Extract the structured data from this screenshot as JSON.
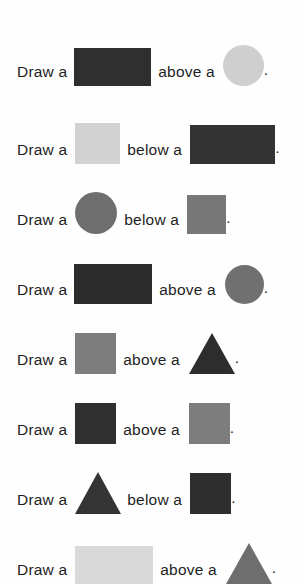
{
  "page": {
    "background": "#fefefe",
    "text_color": "#1f1f1f",
    "width": 305,
    "height": 582,
    "font_size_px": 15.5
  },
  "palette": {
    "very_dark": "#2e2e2e",
    "dark": "#333333",
    "darker": "#2b2b2b",
    "medium_gray": "#808080",
    "gray": "#7a7a7a",
    "light_gray": "#cccccc",
    "very_light_gray": "#d8d8d8",
    "pale_gray": "#dcdcdc"
  },
  "lead_text": "Draw a",
  "period": ".",
  "rows": [
    {
      "index": 1,
      "lead": "Draw a",
      "relation": "above a",
      "period": ".",
      "subject": {
        "shape": "rectangle",
        "color": "#2f2f2f",
        "width": 77,
        "height": 38,
        "label": "dark rectangle"
      },
      "object": {
        "shape": "circle",
        "color": "#cfcfcf",
        "width": 41,
        "height": 41,
        "label": "light gray circle"
      },
      "y": 14,
      "subject_left": 7,
      "relation_gap": 7,
      "object_gap": 8
    },
    {
      "index": 2,
      "lead": "Draw a",
      "relation": "below a",
      "period": ".",
      "subject": {
        "shape": "square",
        "color": "#d2d2d2",
        "width": 45,
        "height": 41,
        "label": "light gray square"
      },
      "object": {
        "shape": "rectangle",
        "color": "#333333",
        "width": 85,
        "height": 39,
        "label": "dark rectangle"
      },
      "y": 92,
      "subject_left": 8,
      "relation_gap": 7,
      "object_gap": 8
    },
    {
      "index": 3,
      "lead": "Draw a",
      "relation": "below a",
      "period": ".",
      "subject": {
        "shape": "circle",
        "color": "#6e6e6e",
        "width": 42,
        "height": 42,
        "label": "gray circle"
      },
      "object": {
        "shape": "square",
        "color": "#787878",
        "width": 39,
        "height": 39,
        "label": "gray square"
      },
      "y": 162,
      "subject_left": 8,
      "relation_gap": 7,
      "object_gap": 8
    },
    {
      "index": 4,
      "lead": "Draw a",
      "relation": "above a",
      "period": ".",
      "subject": {
        "shape": "rectangle",
        "color": "#2c2c2c",
        "width": 78,
        "height": 40,
        "label": "dark rectangle"
      },
      "object": {
        "shape": "circle",
        "color": "#707070",
        "width": 39,
        "height": 39,
        "label": "gray circle"
      },
      "y": 232,
      "subject_left": 7,
      "relation_gap": 7,
      "object_gap": 9
    },
    {
      "index": 5,
      "lead": "Draw a",
      "relation": "above a",
      "period": ".",
      "subject": {
        "shape": "square",
        "color": "#7d7d7d",
        "width": 41,
        "height": 41,
        "label": "gray square"
      },
      "object": {
        "shape": "triangle",
        "color": "#2d2d2d",
        "width": 46,
        "height": 41,
        "label": "dark triangle"
      },
      "y": 302,
      "subject_left": 8,
      "relation_gap": 7,
      "object_gap": 9
    },
    {
      "index": 6,
      "lead": "Draw a",
      "relation": "above a",
      "period": ".",
      "subject": {
        "shape": "square",
        "color": "#303030",
        "width": 41,
        "height": 41,
        "label": "dark square"
      },
      "object": {
        "shape": "square",
        "color": "#7d7d7d",
        "width": 41,
        "height": 41,
        "label": "gray square"
      },
      "y": 372,
      "subject_left": 8,
      "relation_gap": 7,
      "object_gap": 9
    },
    {
      "index": 7,
      "lead": "Draw a",
      "relation": "below a",
      "period": ".",
      "subject": {
        "shape": "triangle",
        "color": "#343434",
        "width": 46,
        "height": 42,
        "label": "dark triangle"
      },
      "object": {
        "shape": "square",
        "color": "#2e2e2e",
        "width": 41,
        "height": 41,
        "label": "dark square"
      },
      "y": 442,
      "subject_left": 8,
      "relation_gap": 6,
      "object_gap": 8
    },
    {
      "index": 8,
      "lead": "Draw a",
      "relation": "above a",
      "period": ".",
      "subject": {
        "shape": "rectangle",
        "color": "#d9d9d9",
        "width": 78,
        "height": 38,
        "label": "very light gray rectangle"
      },
      "object": {
        "shape": "triangle",
        "color": "#6e6e6e",
        "width": 46,
        "height": 41,
        "label": "gray triangle"
      },
      "y": 512,
      "subject_left": 8,
      "relation_gap": 7,
      "object_gap": 9
    }
  ]
}
